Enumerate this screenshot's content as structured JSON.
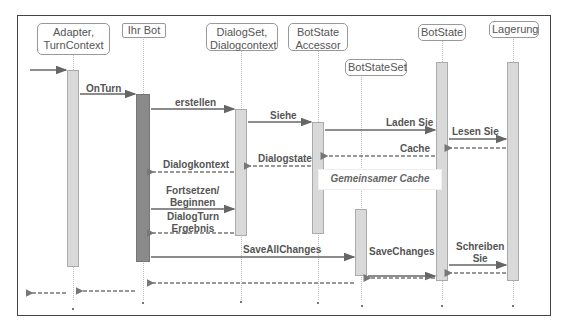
{
  "diagram": {
    "type": "sequence",
    "participants": [
      {
        "id": "adapter",
        "label": "Adapter,\nTurnContext"
      },
      {
        "id": "bot",
        "label": "Ihr Bot"
      },
      {
        "id": "dialogset",
        "label": "DialogSet,\nDialogcontext"
      },
      {
        "id": "accessor",
        "label": "BotState\nAccessor"
      },
      {
        "id": "botstateset",
        "label": "BotStateSet"
      },
      {
        "id": "botstate",
        "label": "BotState"
      },
      {
        "id": "lagerung",
        "label": "Lagerung"
      }
    ],
    "messages": [
      {
        "from": "external",
        "to": "adapter",
        "label": "",
        "style": "solid"
      },
      {
        "from": "adapter",
        "to": "bot",
        "label": "OnTurn",
        "style": "solid"
      },
      {
        "from": "bot",
        "to": "dialogset",
        "label": "erstellen",
        "style": "solid"
      },
      {
        "from": "dialogset",
        "to": "accessor",
        "label": "Siehe",
        "style": "solid"
      },
      {
        "from": "accessor",
        "to": "botstate",
        "label": "Laden Sie",
        "style": "solid"
      },
      {
        "from": "botstate",
        "to": "lagerung",
        "label": "Lesen Sie",
        "style": "solid"
      },
      {
        "from": "lagerung",
        "to": "botstate",
        "label": "",
        "style": "dashed"
      },
      {
        "from": "botstate",
        "to": "accessor",
        "label": "Cache",
        "style": "dashed"
      },
      {
        "from": "accessor",
        "to": "dialogset",
        "label": "Dialogstate",
        "style": "dashed"
      },
      {
        "from": "dialogset",
        "to": "bot",
        "label": "Dialogkontext",
        "style": "dashed"
      },
      {
        "from": "bot",
        "to": "dialogset",
        "label": "Fortsetzen/\nBeginnen",
        "style": "solid"
      },
      {
        "from": "dialogset",
        "to": "bot",
        "label": "DialogTurn\nErgebnis",
        "style": "dashed"
      },
      {
        "from": "bot",
        "to": "botstateset",
        "label": "SaveAllChanges",
        "style": "solid"
      },
      {
        "from": "botstateset",
        "to": "botstate",
        "label": "SaveChanges",
        "style": "solid"
      },
      {
        "from": "botstate",
        "to": "lagerung",
        "label": "Schreiben\nSie",
        "style": "solid"
      },
      {
        "from": "lagerung",
        "to": "botstate",
        "label": "",
        "style": "dashed"
      },
      {
        "from": "botstate",
        "to": "botstateset",
        "label": "",
        "style": "dashed"
      },
      {
        "from": "botstateset",
        "to": "bot",
        "label": "",
        "style": "dashed"
      },
      {
        "from": "bot",
        "to": "adapter",
        "label": "",
        "style": "dashed"
      },
      {
        "from": "adapter",
        "to": "external",
        "label": "",
        "style": "dashed"
      }
    ],
    "note": "Gemeinsamer Cache"
  },
  "headers": {
    "adapter_l1": "Adapter,",
    "adapter_l2": "TurnContext",
    "bot": "Ihr Bot",
    "dialogset_l1": "DialogSet,",
    "dialogset_l2": "Dialogcontext",
    "accessor_l1": "BotState",
    "accessor_l2": "Accessor",
    "botstateset": "BotStateSet",
    "botstate": "BotState",
    "lagerung": "Lagerung"
  },
  "labels": {
    "onturn": "OnTurn",
    "erstellen": "erstellen",
    "siehe": "Siehe",
    "laden": "Laden Sie",
    "lesen": "Lesen Sie",
    "cache": "Cache",
    "dialogstate": "Dialogstate",
    "dialogkontext": "Dialogkontext",
    "fortsetzen_l1": "Fortsetzen/",
    "fortsetzen_l2": "Beginnen",
    "dialogturn_l1": "DialogTurn",
    "dialogturn_l2": "Ergebnis",
    "saveall": "SaveAllChanges",
    "savechanges": "SaveChanges",
    "schreiben_l1": "Schreiben",
    "schreiben_l2": "Sie",
    "gemeinsamer_cache": "Gemeinsamer Cache"
  },
  "colors": {
    "frame": "#444444",
    "arrow": "#666666",
    "activation": "#d9d9d9",
    "activation_bot": "#8a8a8a",
    "text": "#555555"
  }
}
